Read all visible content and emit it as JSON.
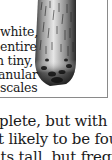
{
  "caption": {
    "lines": [
      "white,",
      "entire",
      "h tiny,",
      "anular",
      "scales"
    ]
  },
  "illustration": {
    "subject": "shaggy-mane-mushroom-cap",
    "style": "black-and-white engraving"
  },
  "body": {
    "lines": [
      "plete, but with an orange",
      "t likely to be found grow-",
      "its tall, but frequently the"
    ]
  },
  "colors": {
    "text": "#1a1a1a",
    "border": "#8a8a8a",
    "background": "#ffffff"
  }
}
